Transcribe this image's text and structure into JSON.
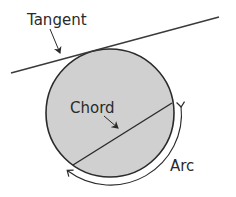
{
  "diagram": {
    "labels": {
      "tangent": "Tangent",
      "chord": "Chord",
      "arc": "Arc"
    },
    "colors": {
      "circle_fill": "#d0d0d0",
      "stroke": "#2a2a2a",
      "background": "#ffffff"
    },
    "circle": {
      "cx": 110,
      "cy": 113,
      "r": 64
    }
  }
}
